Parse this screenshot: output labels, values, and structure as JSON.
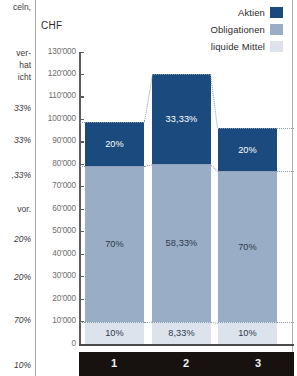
{
  "chart_data": {
    "type": "bar",
    "subtype": "stacked-bar-100-percent-with-absolute-axis",
    "title": "",
    "xlabel": "",
    "ylabel": "CHF",
    "ylim": [
      0,
      130000
    ],
    "ytick_step": 10000,
    "grid": false,
    "legend_position": "top-right",
    "categories": [
      "1",
      "2",
      "3"
    ],
    "ytick_labels": [
      "130'000",
      "120'000",
      "110'000",
      "100'000",
      "90'000",
      "80'000",
      "70'000",
      "60'000",
      "50'000",
      "40'000",
      "30'000",
      "20'000",
      "10'000",
      "0"
    ],
    "ytick_values": [
      130000,
      120000,
      110000,
      100000,
      90000,
      80000,
      70000,
      60000,
      50000,
      40000,
      30000,
      20000,
      10000,
      0
    ],
    "bar_totals": [
      99000,
      120000,
      96000
    ],
    "series": [
      {
        "name": "Aktien",
        "color": "#1b4a7e",
        "values": [
          19800,
          40000,
          19200
        ],
        "percent_labels": [
          "20%",
          "33,33%",
          "20%"
        ],
        "percents": [
          20,
          33.33,
          20
        ]
      },
      {
        "name": "Obligationen",
        "color": "#9aadc6",
        "values": [
          69300,
          70000,
          67200
        ],
        "percent_labels": [
          "70%",
          "58,33%",
          "70%"
        ],
        "percents": [
          70,
          58.33,
          70
        ]
      },
      {
        "name": "liquide Mittel",
        "color": "#dde3ec",
        "values": [
          9900,
          10000,
          9600
        ],
        "percent_labels": [
          "10%",
          "8,33%",
          "10%"
        ],
        "percents": [
          10,
          8.33,
          10
        ]
      }
    ]
  },
  "legend": {
    "items": [
      {
        "label": "Aktien",
        "color": "#1b4a7e"
      },
      {
        "label": "Obligationen",
        "color": "#9aadc6"
      },
      {
        "label": "liquide Mittel",
        "color": "#dde3ec"
      }
    ]
  },
  "axis": {
    "y_title": "CHF"
  },
  "left_margin_text": {
    "lines": [
      "celn,",
      "ver-",
      "hat",
      "icht",
      "33%",
      "33%",
      ",33%",
      "vor.",
      "20%",
      "20%",
      "70%",
      "10%"
    ]
  }
}
